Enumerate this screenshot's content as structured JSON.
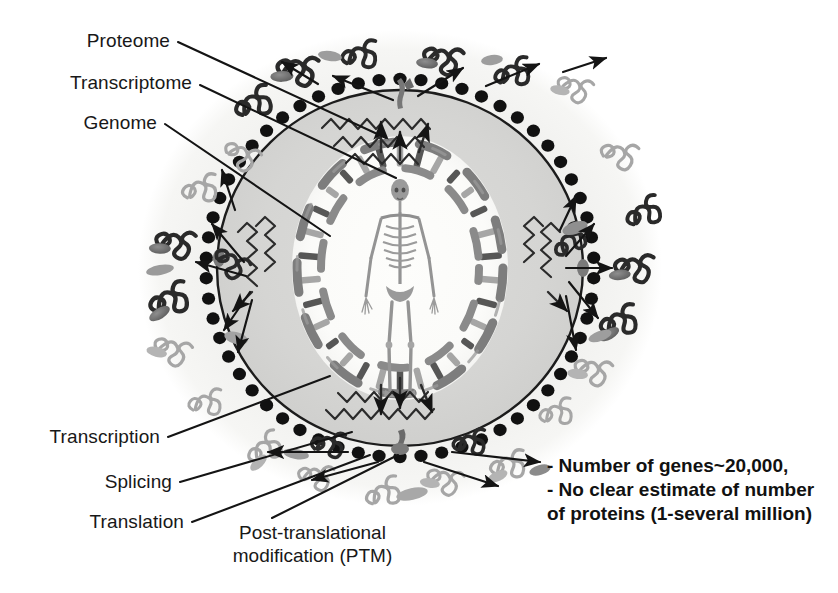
{
  "figure": {
    "title_alt": "Central dogma in a human cell: genome, transcriptome, proteome",
    "colors": {
      "cell_fill": "#f2f2f0",
      "nucleus_fill": "#d6d6d4",
      "nucleolus_fill": "#fbfbf9",
      "envelope_stroke": "#1c1c1c",
      "ribosome_dot": "#111111",
      "dna_strand": "#7d7d7d",
      "protein_dark": "#2a2a2a",
      "protein_light": "#a9a9a9",
      "ptm_blob": "#6f6f6f",
      "arrow": "#141414",
      "leader_line": "#141414",
      "text": "#181818",
      "background": "#ffffff"
    }
  },
  "labels": {
    "proteome": "Proteome",
    "transcriptome": "Transcriptome",
    "genome": "Genome",
    "transcription": "Transcription",
    "splicing": "Splicing",
    "translation": "Translation",
    "ptm_line1": "Post-translational",
    "ptm_line2": "modification (PTM)"
  },
  "note": {
    "line1": "- Number of genes~20,000,",
    "line2": "- No clear estimate of number",
    "line3": "of proteins (1-several million)"
  },
  "icons": {
    "cell": "cell-icon",
    "nucleus": "nucleus-icon",
    "dna": "dna-helix-icon",
    "skeleton": "human-skeleton-icon",
    "ribosome": "ribosome-dot-icon",
    "mrna": "mrna-transcript-icon",
    "protein": "protein-squiggle-icon",
    "ptm_blob": "ptm-blob-icon",
    "pore": "nuclear-pore-icon",
    "arrow": "arrow-icon"
  }
}
